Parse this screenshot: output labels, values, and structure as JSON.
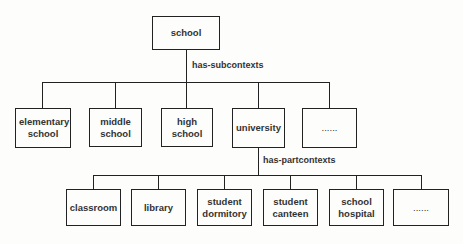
{
  "root": {
    "label": "school"
  },
  "relations": {
    "level1": "has-subcontexts",
    "level2": "has-partcontexts"
  },
  "level1": [
    {
      "label": "elementary school"
    },
    {
      "label": "middle school"
    },
    {
      "label": "high school"
    },
    {
      "label": "university"
    },
    {
      "label": "......"
    }
  ],
  "level2": [
    {
      "label": "classroom"
    },
    {
      "label": "library"
    },
    {
      "label": "student dormitory"
    },
    {
      "label": "student canteen"
    },
    {
      "label": "school hospital"
    },
    {
      "label": "......"
    }
  ]
}
